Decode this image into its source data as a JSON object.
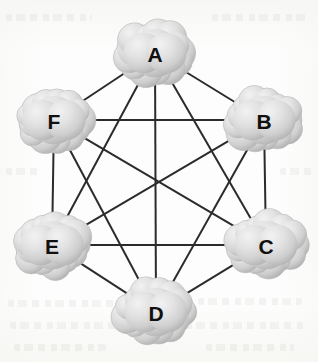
{
  "diagram": {
    "type": "network-graph",
    "topology": "full-mesh",
    "background_color": "#fdfdfd",
    "edge_color": "#2b2b2b",
    "edge_width": 2,
    "node_shape": "cloud",
    "node_fill_light": "#eeeeee",
    "node_fill_mid": "#d9d9d9",
    "node_fill_dark": "#b4b4b4",
    "node_outline": "#b9b9b9",
    "label_color": "#101010",
    "nodes": [
      {
        "id": "A",
        "label": "A",
        "x": 155,
        "y": 53,
        "rx": 38,
        "ry": 29
      },
      {
        "id": "B",
        "label": "B",
        "x": 264,
        "y": 120,
        "rx": 38,
        "ry": 29
      },
      {
        "id": "C",
        "label": "C",
        "x": 266,
        "y": 245,
        "rx": 38,
        "ry": 29
      },
      {
        "id": "D",
        "label": "D",
        "x": 156,
        "y": 312,
        "rx": 38,
        "ry": 29
      },
      {
        "id": "E",
        "label": "E",
        "x": 52,
        "y": 245,
        "rx": 38,
        "ry": 29
      },
      {
        "id": "F",
        "label": "F",
        "x": 54,
        "y": 120,
        "rx": 38,
        "ry": 29
      }
    ],
    "edges": [
      {
        "from": "A",
        "to": "B"
      },
      {
        "from": "A",
        "to": "C"
      },
      {
        "from": "A",
        "to": "D"
      },
      {
        "from": "A",
        "to": "E"
      },
      {
        "from": "A",
        "to": "F"
      },
      {
        "from": "B",
        "to": "C"
      },
      {
        "from": "B",
        "to": "D"
      },
      {
        "from": "B",
        "to": "E"
      },
      {
        "from": "B",
        "to": "F"
      },
      {
        "from": "C",
        "to": "D"
      },
      {
        "from": "C",
        "to": "E"
      },
      {
        "from": "C",
        "to": "F"
      },
      {
        "from": "D",
        "to": "E"
      },
      {
        "from": "D",
        "to": "F"
      },
      {
        "from": "E",
        "to": "F"
      }
    ],
    "ghost_artifacts": [
      {
        "x": 8,
        "y": 300,
        "w": 120
      },
      {
        "x": 10,
        "y": 322,
        "w": 138
      },
      {
        "x": 198,
        "y": 298,
        "w": 104
      },
      {
        "x": 186,
        "y": 322,
        "w": 118
      },
      {
        "x": 14,
        "y": 344,
        "w": 92
      },
      {
        "x": 206,
        "y": 344,
        "w": 88
      },
      {
        "x": 6,
        "y": 14,
        "w": 86
      },
      {
        "x": 212,
        "y": 14,
        "w": 96
      },
      {
        "x": 6,
        "y": 168,
        "w": 34
      },
      {
        "x": 280,
        "y": 168,
        "w": 32
      }
    ]
  }
}
